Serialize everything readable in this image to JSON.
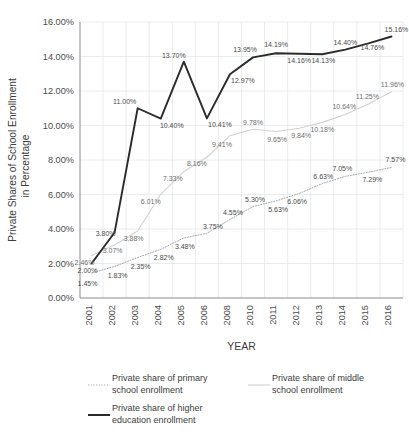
{
  "chart_data": {
    "type": "line",
    "title": "",
    "xlabel": "YEAR",
    "ylabel": "Private Shares of School Enrollment in Percentage",
    "categories": [
      "2001",
      "2002",
      "2003",
      "2004",
      "2005",
      "2006",
      "2008",
      "2010",
      "2011",
      "2012",
      "2013",
      "2014",
      "2015",
      "2016"
    ],
    "ylim": [
      0,
      16
    ],
    "ytick_labels": [
      "0.00%",
      "2.00%",
      "4.00%",
      "6.00%",
      "8.00%",
      "10.00%",
      "12.00%",
      "14.00%",
      "16.00%"
    ],
    "ytick_values": [
      0,
      2,
      4,
      6,
      8,
      10,
      12,
      14,
      16
    ],
    "grid": true,
    "legend_position": "bottom",
    "series": [
      {
        "name": "Private share of primary school enrollment",
        "style": "dotted",
        "color": "#9a9a9a",
        "values": [
          1.45,
          1.83,
          2.35,
          2.82,
          3.48,
          3.75,
          4.55,
          5.3,
          5.63,
          6.06,
          6.63,
          7.05,
          7.29,
          7.57
        ],
        "labels": [
          "1.45%",
          "1.83%",
          "2.35%",
          "2.82%",
          "3.48%",
          "3.75%",
          "4.55%",
          "5.30%",
          "5.63%",
          "6.06%",
          "6.63%",
          "7.05%",
          "7.29%",
          "7.57%"
        ]
      },
      {
        "name": "Private share of middle school enrollment",
        "style": "solid-light",
        "color": "#d2d2d2",
        "values": [
          2.46,
          3.07,
          3.88,
          6.01,
          7.33,
          8.16,
          9.41,
          9.78,
          9.65,
          9.84,
          10.18,
          10.64,
          11.25,
          11.96
        ],
        "labels": [
          "2.46%",
          "3.07%",
          "3.88%",
          "6.01%",
          "7.33%",
          "8.16%",
          "9.41%",
          "9.78%",
          "9.65%",
          "9.84%",
          "10.18%",
          "10.64%",
          "11.25%",
          "11.96%"
        ]
      },
      {
        "name": "Private share of higher education enrollment",
        "style": "solid-bold",
        "color": "#2b2b2b",
        "values": [
          2.0,
          3.8,
          11.0,
          10.4,
          13.7,
          10.41,
          12.97,
          13.95,
          14.19,
          14.16,
          14.13,
          14.4,
          14.76,
          15.16
        ],
        "labels": [
          "2.00%",
          "3.80%",
          "11.00%",
          "10.40%",
          "13.70%",
          "10.41%",
          "12.97%",
          "13.95%",
          "14.19%",
          "14.16%",
          "14.13%",
          "14.40%",
          "14.76%",
          "15.16%"
        ]
      }
    ]
  },
  "legend": {
    "items": [
      {
        "label_line1": "Private share of primary",
        "label_line2": "school enrollment",
        "key": "dotted"
      },
      {
        "label_line1": "Private share of middle",
        "label_line2": "school enrollment",
        "key": "solid-light"
      },
      {
        "label_line1": "Private share of higher",
        "label_line2": "education enrollment",
        "key": "solid-bold"
      }
    ]
  }
}
